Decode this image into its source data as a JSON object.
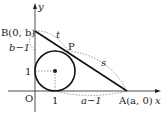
{
  "labels": {
    "y_axis": "y",
    "x_axis": "x",
    "origin": "O",
    "point_b": "B(0, b)",
    "point_a": "A(a, 0)",
    "point_p": "P",
    "seg_t": "t",
    "seg_s": "s",
    "b_minus_1": "b−1",
    "a_minus_1": "a−1",
    "one_y": "1",
    "one_x": "1"
  },
  "colors": {
    "stroke": "#222222"
  }
}
